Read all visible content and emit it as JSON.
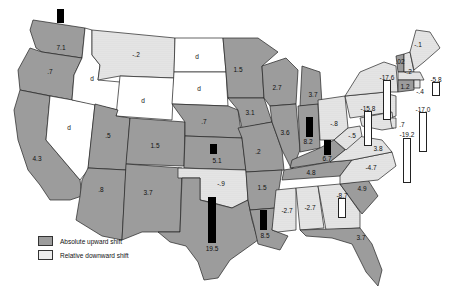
{
  "legend": {
    "items": [
      {
        "label": "Absolute upward shift",
        "type": "up"
      },
      {
        "label": "Relative downward shift",
        "type": "down"
      }
    ]
  },
  "colors": {
    "up": "#9c9c9c",
    "down": "#ececec",
    "nodata": "#ffffff",
    "bar_up": "#000000",
    "bar_down": "#ffffff"
  },
  "states": {
    "WA": "7.1",
    "OR": ".7",
    "CA": "4.3",
    "ID": "d",
    "NV": "d",
    "MT": "-.2",
    "WY": "d",
    "UT": ".5",
    "AZ": ".8",
    "CO": "1.5",
    "NM": "3.7",
    "ND": "d",
    "SD": "d",
    "NE": ".7",
    "KS": "5.1",
    "OK": "-.9",
    "TX": "19.5",
    "MN": "1.5",
    "IA": "3.1",
    "MO": ".2",
    "AR": "1.5",
    "LA": "8.5",
    "WI": "2.7",
    "IL": "3.6",
    "MI": "3.7",
    "IN": "8.2",
    "KY": "6.7",
    "OH": "-.8",
    "TN": "4.8",
    "MS": "-2.7",
    "AL": "-2.7",
    "GA": "-8.7",
    "FL": "3.7",
    "SC": "4.9",
    "NC": "-4.7",
    "WV": "-.5",
    "VA": "3.8",
    "PA": "-15.8",
    "NY": "-17.6",
    "NJ": "-17.0",
    "DE": ".7",
    "MD": "-19.2",
    "VT": ".02",
    "NH": "-.2",
    "ME": "-.1",
    "MA": "-5.8",
    "CT": "1.2",
    "RI": "-.4"
  }
}
